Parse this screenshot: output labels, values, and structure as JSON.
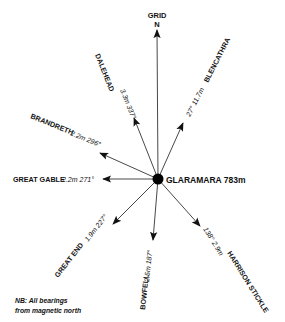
{
  "diagram": {
    "center": {
      "name": "GLARAMARA",
      "height": "783m",
      "label": "GLARAMARA 783m"
    },
    "north": {
      "line1": "GRID",
      "line2": "N"
    },
    "destinations": [
      {
        "name": "DALEHEAD",
        "distance": "3.3m",
        "bearing": "337°",
        "text": "3.3m 337°"
      },
      {
        "name": "BLENCATHRA",
        "distance": "11.7m",
        "bearing": "27°",
        "text": "27° 11.7m"
      },
      {
        "name": "BRANDRETH",
        "distance": "2.2m",
        "bearing": "296°",
        "text": "2.2m 296°"
      },
      {
        "name": "GREAT GABLE",
        "distance": "2.2m",
        "bearing": "271°",
        "text": "2.2m 271°"
      },
      {
        "name": "GREAT END",
        "distance": "1.9m",
        "bearing": "227°",
        "text": "1.9m 227°"
      },
      {
        "name": "BOWFELL",
        "distance": "2.5m",
        "bearing": "187°",
        "text": "2.5m 187°"
      },
      {
        "name": "HARRISON STICKLE",
        "distance": "2.9m",
        "bearing": "138°",
        "text": "138° 2.9m"
      }
    ],
    "note": {
      "line1": "NB: All bearings",
      "line2": "from magnetic north"
    }
  }
}
